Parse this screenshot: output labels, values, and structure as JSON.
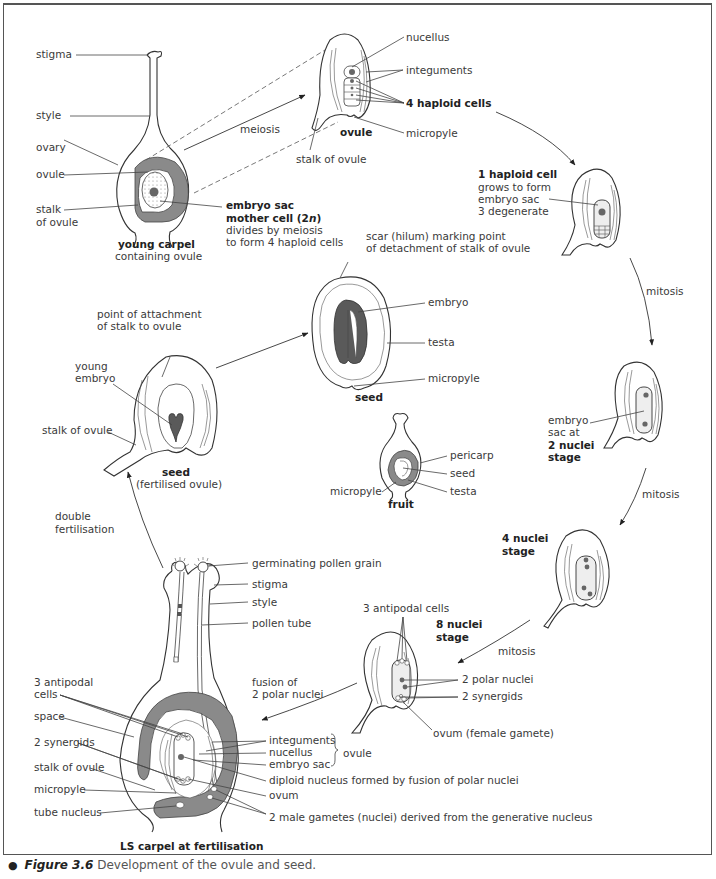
{
  "figure": {
    "number_label": "Figure 3.6",
    "caption": "Development of the ovule and seed.",
    "bullet": "●"
  },
  "young_carpel": {
    "title": "young carpel",
    "subtitle": "containing ovule",
    "labels": {
      "stigma": "stigma",
      "style": "style",
      "ovary": "ovary",
      "ovule": "ovule",
      "stalk_line1": "stalk",
      "stalk_line2": "of ovule"
    },
    "mother_cell": {
      "line1": "embryo sac",
      "line2": "mother cell (2",
      "line2_italic": "n",
      "line2_end": ")",
      "line3": "divides by meiosis",
      "line4": "to form 4 haploid cells"
    }
  },
  "ovule_stage": {
    "title": "ovule",
    "arrow_label": "meiosis",
    "labels": {
      "nucellus": "nucellus",
      "integuments": "integuments",
      "haploid_cells": "4 haploid cells",
      "micropyle": "micropyle",
      "stalk": "stalk of ovule"
    }
  },
  "one_haploid": {
    "line1": "1 haploid cell",
    "line2": "grows to form",
    "line3": "embryo sac",
    "line4": "3 degenerate"
  },
  "two_nuclei": {
    "arrow_label": "mitosis",
    "line1": "embryo",
    "line2": "sac at",
    "line3": "2 nuclei",
    "line4": "stage"
  },
  "four_nuclei": {
    "arrow_label": "mitosis",
    "line1": "4 nuclei",
    "line2": "stage"
  },
  "eight_nuclei": {
    "arrow_label": "mitosis",
    "line1": "8 nuclei",
    "line2": "stage",
    "labels": {
      "antipodal": "3 antipodal cells",
      "polar": "2 polar nuclei",
      "synergids": "2 synergids",
      "ovum": "ovum (female gamete)"
    }
  },
  "fertilisation": {
    "title": "LS carpel at fertilisation",
    "arrow_label_line1": "fusion of",
    "arrow_label_line2": "2 polar nuclei",
    "labels": {
      "pollen_grain": "germinating pollen grain",
      "stigma": "stigma",
      "style": "style",
      "pollen_tube": "pollen tube",
      "antipodal_line1": "3 antipodal",
      "antipodal_line2": "cells",
      "space": "space",
      "synergids": "2 synergids",
      "stalk": "stalk of ovule",
      "micropyle": "micropyle",
      "tube_nucleus": "tube nucleus",
      "integuments": "integuments",
      "nucellus": "nucellus",
      "embryo_sac": "embryo sac",
      "ovule_group": "ovule",
      "diploid": "diploid nucleus formed by fusion of polar nuclei",
      "ovum": "ovum",
      "male_gametes": "2 male gametes (nuclei) derived from the generative nucleus"
    }
  },
  "fertilised_ovule": {
    "title": "seed",
    "subtitle": "(fertilised ovule)",
    "arrow_label_line1": "double",
    "arrow_label_line2": "fertilisation",
    "labels": {
      "attachment_line1": "point of attachment",
      "attachment_line2": "of stalk to ovule",
      "embryo_line1": "young",
      "embryo_line2": "embryo",
      "stalk": "stalk of ovule"
    }
  },
  "seed": {
    "title": "seed",
    "labels": {
      "scar_line1": "scar (hilum) marking point",
      "scar_line2": "of detachment of stalk of ovule",
      "embryo": "embryo",
      "testa": "testa",
      "micropyle": "micropyle"
    }
  },
  "fruit": {
    "title": "fruit",
    "labels": {
      "pericarp": "pericarp",
      "seed": "seed",
      "testa": "testa",
      "micropyle": "micropyle"
    }
  }
}
